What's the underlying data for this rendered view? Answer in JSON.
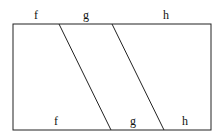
{
  "diagram": {
    "top_labels": [
      "f",
      "g",
      "h"
    ],
    "bottom_labels": [
      "f",
      "g",
      "h"
    ],
    "stroke_color": "#222222",
    "rect": {
      "x": 13,
      "y": 24,
      "w": 198,
      "h": 106
    },
    "dividers": [
      {
        "x_top": 59,
        "x_bottom": 111
      },
      {
        "x_top": 112,
        "x_bottom": 164
      }
    ]
  }
}
